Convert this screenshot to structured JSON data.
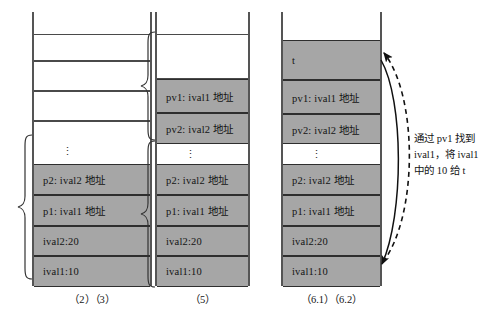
{
  "diagram": {
    "title": "",
    "colors": {
      "filled_cell": "#a6a6a6",
      "empty_cell": "#ffffff",
      "line": "#4a4a4a",
      "text": "#141414"
    },
    "columns": [
      {
        "id": "col-1",
        "caption": "（2）（3）",
        "cells": [
          {
            "label": "",
            "state": "empty"
          },
          {
            "label": "",
            "state": "empty"
          },
          {
            "label": "",
            "state": "empty"
          },
          {
            "label": "",
            "state": "empty"
          },
          {
            "label": "⋮",
            "state": "dots"
          },
          {
            "label": "p2: ival2 地址",
            "state": "filled"
          },
          {
            "label": "p1: ival1 地址",
            "state": "filled"
          },
          {
            "label": "ival2:20",
            "state": "filled"
          },
          {
            "label": "ival1:10",
            "state": "filled"
          }
        ],
        "braces": [
          {
            "id": "brace-col1-locals",
            "from_cell": 4,
            "to_cell": 8
          }
        ]
      },
      {
        "id": "col-2",
        "caption": "（5）",
        "cells": [
          {
            "label": "",
            "state": "empty"
          },
          {
            "label": "pv1: ival1 地址",
            "state": "filled"
          },
          {
            "label": "pv2: ival2 地址",
            "state": "filled"
          },
          {
            "label": "⋮",
            "state": "dots"
          },
          {
            "label": "p2: ival2 地址",
            "state": "filled"
          },
          {
            "label": "p1: ival1 地址",
            "state": "filled"
          },
          {
            "label": "ival2:20",
            "state": "filled"
          },
          {
            "label": "ival1:10",
            "state": "filled"
          }
        ],
        "braces": [
          {
            "id": "brace-col2-upper",
            "from_cell": 0,
            "to_cell": 2
          },
          {
            "id": "brace-col2-lower",
            "from_cell": 3,
            "to_cell": 7
          }
        ]
      },
      {
        "id": "col-3",
        "caption": "（6.1）（6.2）",
        "cells": [
          {
            "label": "t",
            "state": "filled"
          },
          {
            "label": "pv1: ival1 地址",
            "state": "filled"
          },
          {
            "label": "pv2: ival2 地址",
            "state": "filled"
          },
          {
            "label": "⋮",
            "state": "dots"
          },
          {
            "label": "p2: ival2 地址",
            "state": "filled"
          },
          {
            "label": "p1: ival1 地址",
            "state": "filled"
          },
          {
            "label": "ival2:20",
            "state": "filled"
          },
          {
            "label": "ival1:10",
            "state": "filled"
          }
        ],
        "braces": []
      }
    ],
    "annotation": {
      "id": "annotation-pv1",
      "lines": [
        "通过 pv1 找到",
        "ival1，将 ival1",
        "中的 10 给 t"
      ]
    },
    "arrows": [
      {
        "id": "arrow-solid-down",
        "style": "solid",
        "from": "t-cell-right",
        "to": "ival1-cell-right",
        "direction": "down"
      },
      {
        "id": "arrow-dashed-up",
        "style": "dashed",
        "from": "ival1-cell-right",
        "to": "t-cell-right",
        "direction": "up"
      }
    ]
  }
}
